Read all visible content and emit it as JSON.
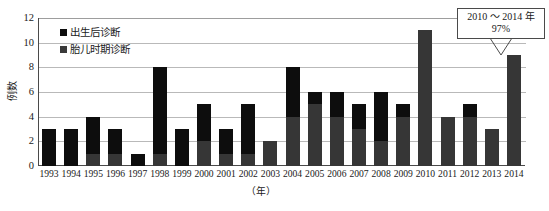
{
  "axes": {
    "y_label": "例数",
    "y_ticks": [
      "12",
      "10",
      "8",
      "6",
      "4",
      "2",
      "0"
    ],
    "x_title": "（年）"
  },
  "legend": {
    "items": [
      {
        "label": "出生后诊断",
        "color": "#0d0d0d",
        "key": "postnatal"
      },
      {
        "label": "胎儿时期诊断",
        "color": "#3a3a3a",
        "key": "fetal"
      }
    ]
  },
  "callout": {
    "line1": "2010 ～ 2014 年",
    "line2": "97%",
    "points_to": "2014"
  },
  "chart_data": {
    "type": "bar",
    "stacked": true,
    "title": "",
    "xlabel": "（年）",
    "ylabel": "例数",
    "ylim": [
      0,
      12
    ],
    "ytick_step": 2,
    "grid": true,
    "legend_position": "top-left",
    "categories": [
      "1993",
      "1994",
      "1995",
      "1996",
      "1997",
      "1998",
      "1999",
      "2000",
      "2001",
      "2002",
      "2003",
      "2004",
      "2005",
      "2006",
      "2007",
      "2008",
      "2009",
      "2010",
      "2011",
      "2012",
      "2013",
      "2014"
    ],
    "series": [
      {
        "name": "胎儿时期诊断",
        "color": "#363636",
        "values": [
          0,
          0,
          1,
          1,
          0,
          1,
          0,
          2,
          1,
          1,
          2,
          4,
          5,
          4,
          3,
          2,
          4,
          11,
          4,
          4,
          3,
          9
        ]
      },
      {
        "name": "出生后诊断",
        "color": "#0d0d0d",
        "values": [
          3,
          3,
          3,
          2,
          1,
          7,
          3,
          3,
          2,
          4,
          0,
          4,
          1,
          2,
          2,
          4,
          1,
          0,
          0,
          1,
          0,
          0
        ]
      }
    ],
    "totals": [
      3,
      3,
      4,
      3,
      1,
      8,
      3,
      5,
      3,
      5,
      2,
      8,
      6,
      6,
      5,
      6,
      5,
      11,
      4,
      5,
      3,
      9
    ],
    "annotations": [
      {
        "text": "2010 ～ 2014 年 97%",
        "target": "2014"
      }
    ]
  }
}
